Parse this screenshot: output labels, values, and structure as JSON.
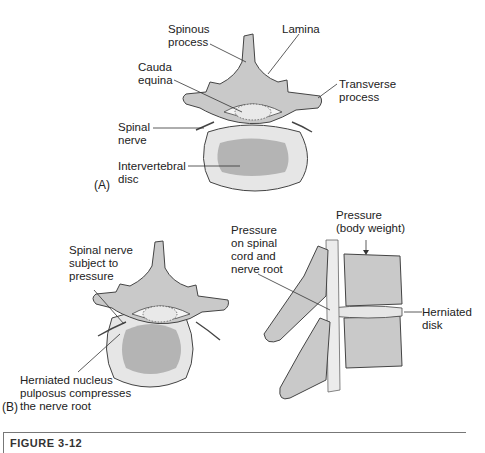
{
  "figure": {
    "panel_a": {
      "tag": "(A)",
      "labels": {
        "spinous_process": "Spinous\nprocess",
        "lamina": "Lamina",
        "cauda_equina": "Cauda\nequina",
        "transverse_process": "Transverse\nprocess",
        "spinal_nerve": "Spinal\nnerve",
        "intervertebral_disc": "Intervertebral\ndisc"
      }
    },
    "panel_b": {
      "tag": "(B)",
      "labels": {
        "spinal_nerve_pressure": "Spinal nerve\nsubject to\npressure",
        "herniated_nucleus": "Herniated nucleus\npulposus compresses\nthe nerve root",
        "pressure_cord": "Pressure\non spinal\ncord and\nnerve root",
        "pressure_body_weight": "Pressure\n(body weight)",
        "herniated_disk": "Herniated\ndisk"
      }
    },
    "caption": "FIGURE 3-12",
    "colors": {
      "bone": "#c9c9c9",
      "bone_dark": "#a8a8a8",
      "disc_outer": "#e6e6e6",
      "disc_inner": "#b4b4b4",
      "outline": "#444444",
      "leader": "#333333"
    }
  }
}
